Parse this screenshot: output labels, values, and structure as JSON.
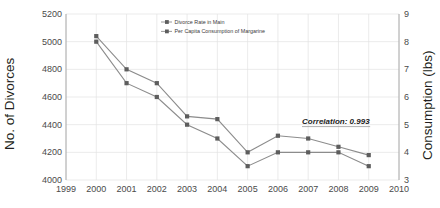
{
  "chart_data": {
    "type": "line",
    "title": "",
    "xlabel": "",
    "grid": true,
    "legend_position": "top-center",
    "x": [
      2000,
      2001,
      2002,
      2003,
      2004,
      2005,
      2006,
      2007,
      2008,
      2009
    ],
    "xlim": [
      1999,
      2010
    ],
    "xticks": [
      "1999",
      "2000",
      "2001",
      "2002",
      "2003",
      "2004",
      "2005",
      "2006",
      "2007",
      "2008",
      "2009",
      "2010"
    ],
    "axes": [
      {
        "id": "left",
        "label": "No. of Divorces",
        "lim": [
          4000,
          5200
        ],
        "ticks": [
          "4000",
          "4200",
          "4400",
          "4600",
          "4800",
          "5000",
          "5200"
        ]
      },
      {
        "id": "right",
        "label": "Consumption (lbs)",
        "lim": [
          3,
          9
        ],
        "ticks": [
          "3",
          "4",
          "5",
          "6",
          "7",
          "8",
          "9"
        ]
      }
    ],
    "series": [
      {
        "name": "Divorce Rate in Main",
        "axis": "left",
        "color": "#8c8c8c",
        "marker": "square",
        "values": [
          5000,
          4700,
          4600,
          4400,
          4300,
          4100,
          4200,
          4200,
          4200,
          4100
        ]
      },
      {
        "name": "Per Capita Consumption of Margarine",
        "axis": "right",
        "color": "#8c8c8c",
        "marker": "square",
        "values": [
          8.2,
          7.0,
          6.5,
          5.3,
          5.2,
          4.0,
          4.6,
          4.5,
          4.2,
          3.9
        ]
      }
    ],
    "annotations": [
      {
        "id": "correlation",
        "text": "Correlation: 0.993",
        "style": "italic-underline"
      }
    ]
  }
}
